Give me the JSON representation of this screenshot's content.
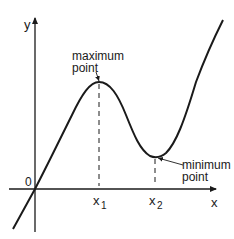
{
  "diagram": {
    "type": "function-graph",
    "axes": {
      "x_label": "x",
      "y_label": "y",
      "origin_label": "0"
    },
    "ticks": {
      "x1": "x",
      "x1_sub": "1",
      "x2": "x",
      "x2_sub": "2"
    },
    "annotations": {
      "maximum_line1": "maximum",
      "maximum_line2": "point",
      "minimum_line1": "minimum",
      "minimum_line2": "point"
    },
    "colors": {
      "stroke": "#1a1a1a",
      "background": "#ffffff"
    }
  }
}
